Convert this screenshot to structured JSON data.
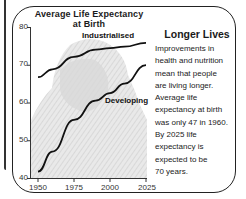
{
  "chart_data": {
    "type": "line",
    "title": "Average Life Expectancy at Birth",
    "title_lines": [
      "Average Life Expectancy",
      "at Birth"
    ],
    "xlabel": "",
    "ylabel": "",
    "x": [
      1950,
      1960,
      1975,
      1990,
      2000,
      2010,
      2025
    ],
    "xticks": [
      "1950",
      "1975",
      "2000",
      "2025"
    ],
    "yticks": [
      "40",
      "50",
      "60",
      "70",
      "80"
    ],
    "xlim": [
      1950,
      2025
    ],
    "ylim": [
      40,
      80
    ],
    "grid": false,
    "legend_position": "inline labels",
    "series": [
      {
        "name": "Industrialised",
        "values": [
          66.7,
          68.8,
          72.1,
          74.0,
          74.4,
          74.8,
          75.8
        ]
      },
      {
        "name": "Developing",
        "values": [
          41.7,
          47.0,
          55.4,
          60.5,
          62.5,
          65.0,
          69.9
        ]
      }
    ]
  },
  "sidebar": {
    "heading": "Longer Lives",
    "lines": [
      "Improvements in",
      "health and nutrition",
      "mean that people",
      "are living longer.",
      "Average life",
      "expectancy at birth",
      "was only 47 in 1960.",
      "By 2025 life",
      "expectancy is",
      "expected to be",
      "70 years."
    ]
  },
  "colors": {
    "line": "#111111",
    "background_image_tint": "#d4d4d4",
    "frame": "#222222"
  }
}
